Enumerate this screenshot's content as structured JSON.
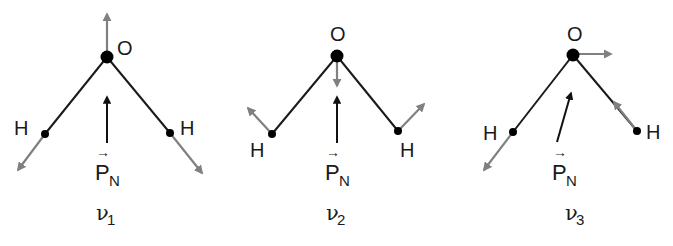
{
  "figure": {
    "colors": {
      "bond": "#1a1a1a",
      "atom": "#000000",
      "displacement_arrow": "#808080",
      "dipole_arrow": "#111111"
    },
    "dipole_label": {
      "symbol": "P",
      "subscript": "N",
      "vector_mark": "→"
    },
    "modes": [
      {
        "id": "nu1",
        "label": {
          "symbol": "ν",
          "subscript": "1"
        },
        "description": "symmetric stretch",
        "atoms": {
          "O": "O",
          "H_left": "H",
          "H_right": "H"
        },
        "O_displacement": "up",
        "H_displacement": "outward along bonds",
        "dipole_direction": "up"
      },
      {
        "id": "nu2",
        "label": {
          "symbol": "ν",
          "subscript": "2"
        },
        "description": "bend",
        "atoms": {
          "O": "O",
          "H_left": "H",
          "H_right": "H"
        },
        "O_displacement": "down",
        "H_displacement": "up and outward",
        "dipole_direction": "up"
      },
      {
        "id": "nu3",
        "label": {
          "symbol": "ν",
          "subscript": "3"
        },
        "description": "asymmetric stretch",
        "atoms": {
          "O": "O",
          "H_left": "H",
          "H_right": "H"
        },
        "O_displacement": "right",
        "H_displacement": "left H outward, right H inward",
        "dipole_direction": "up-right tilted"
      }
    ]
  }
}
